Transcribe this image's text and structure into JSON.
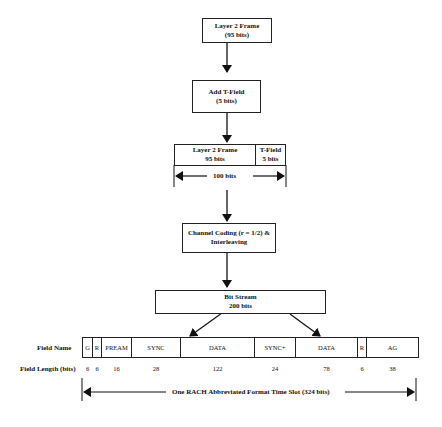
{
  "diagram": {
    "steps": [
      {
        "line1": "Layer 2 Frame",
        "line2": "(95 bits)"
      },
      {
        "line1": "Add T-Field",
        "line2": "(5 bits)"
      },
      {
        "part_a_line1": "Layer 2 Frame",
        "part_a_line2": "95 bits",
        "part_b_line1": "T-Field",
        "part_b_line2": "5 bits",
        "span_label": "100 bits"
      },
      {
        "line1": "Channel Coding (r = 1/2) &",
        "line2": "Interleaving"
      },
      {
        "line1": "Bit Stream",
        "line2": "200 bits"
      }
    ],
    "field_table": {
      "name_row_label": "Field Name",
      "length_row_label": "Field Length (bits)",
      "fields": [
        {
          "name": "G",
          "length": "6"
        },
        {
          "name": "R",
          "length": "6"
        },
        {
          "name": "PREAM",
          "length": "16"
        },
        {
          "name": "SYNC",
          "length": "28"
        },
        {
          "name": "DATA",
          "length": "122"
        },
        {
          "name": "SYNC+",
          "length": "24"
        },
        {
          "name": "DATA",
          "length": "78"
        },
        {
          "name": "R",
          "length": "6"
        },
        {
          "name": "AG",
          "length": "38"
        }
      ],
      "span_label": "One RACH Abbreviated Format Time Slot (324 bits)"
    }
  }
}
